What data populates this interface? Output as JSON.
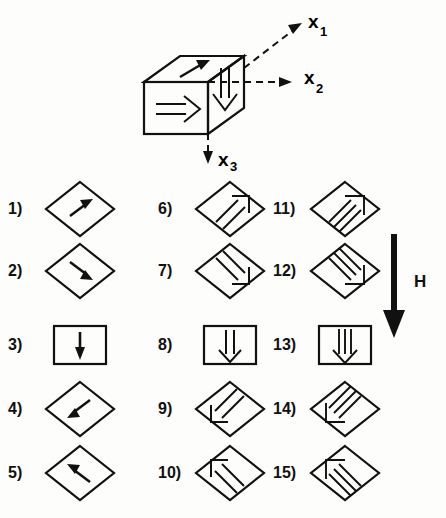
{
  "figure": {
    "background_color": "#fdfdfb",
    "ink_color": "#111111"
  },
  "cube": {
    "name": "magnetic-domain-cube",
    "axes": [
      {
        "id": "x1",
        "label": "x",
        "subscript": "1",
        "direction": "up-right-diagonal",
        "style": "dashed-with-arrowhead"
      },
      {
        "id": "x2",
        "label": "x",
        "subscript": "2",
        "direction": "right-horizontal",
        "style": "dashed-with-arrowhead"
      },
      {
        "id": "x3",
        "label": "x",
        "subscript": "3",
        "direction": "down-vertical",
        "style": "dashed-with-arrowhead"
      }
    ],
    "face_arrows": [
      {
        "face": "top",
        "style": "solid-filled",
        "direction": "up-right"
      },
      {
        "face": "left",
        "style": "hollow-outline",
        "direction": "right"
      },
      {
        "face": "front-right",
        "style": "double-line",
        "direction": "down"
      }
    ]
  },
  "field": {
    "label": "H",
    "direction": "down",
    "style": "thick-solid-filled"
  },
  "states": [
    {
      "num": "1)",
      "shape": "diamond",
      "arrow": "single",
      "direction": "up-right"
    },
    {
      "num": "2)",
      "shape": "diamond",
      "arrow": "single",
      "direction": "down-right"
    },
    {
      "num": "3)",
      "shape": "rectangle",
      "arrow": "single",
      "direction": "down"
    },
    {
      "num": "4)",
      "shape": "diamond",
      "arrow": "single",
      "direction": "down-left"
    },
    {
      "num": "5)",
      "shape": "diamond",
      "arrow": "single",
      "direction": "up-left"
    },
    {
      "num": "6)",
      "shape": "diamond",
      "arrow": "double",
      "direction": "up-right"
    },
    {
      "num": "7)",
      "shape": "diamond",
      "arrow": "double",
      "direction": "down-right"
    },
    {
      "num": "8)",
      "shape": "rectangle",
      "arrow": "double",
      "direction": "down"
    },
    {
      "num": "9)",
      "shape": "diamond",
      "arrow": "double",
      "direction": "down-left"
    },
    {
      "num": "10)",
      "shape": "diamond",
      "arrow": "double",
      "direction": "up-left"
    },
    {
      "num": "11)",
      "shape": "diamond",
      "arrow": "triple",
      "direction": "up-right"
    },
    {
      "num": "12)",
      "shape": "diamond",
      "arrow": "triple",
      "direction": "down-right"
    },
    {
      "num": "13)",
      "shape": "rectangle",
      "arrow": "triple",
      "direction": "down"
    },
    {
      "num": "14)",
      "shape": "diamond",
      "arrow": "triple",
      "direction": "down-left"
    },
    {
      "num": "15)",
      "shape": "diamond",
      "arrow": "triple",
      "direction": "up-left"
    }
  ],
  "layout": {
    "columns": 3,
    "rows": 5,
    "column_x": [
      0,
      150,
      265
    ],
    "row_y": [
      0,
      62,
      136,
      200,
      264
    ]
  }
}
